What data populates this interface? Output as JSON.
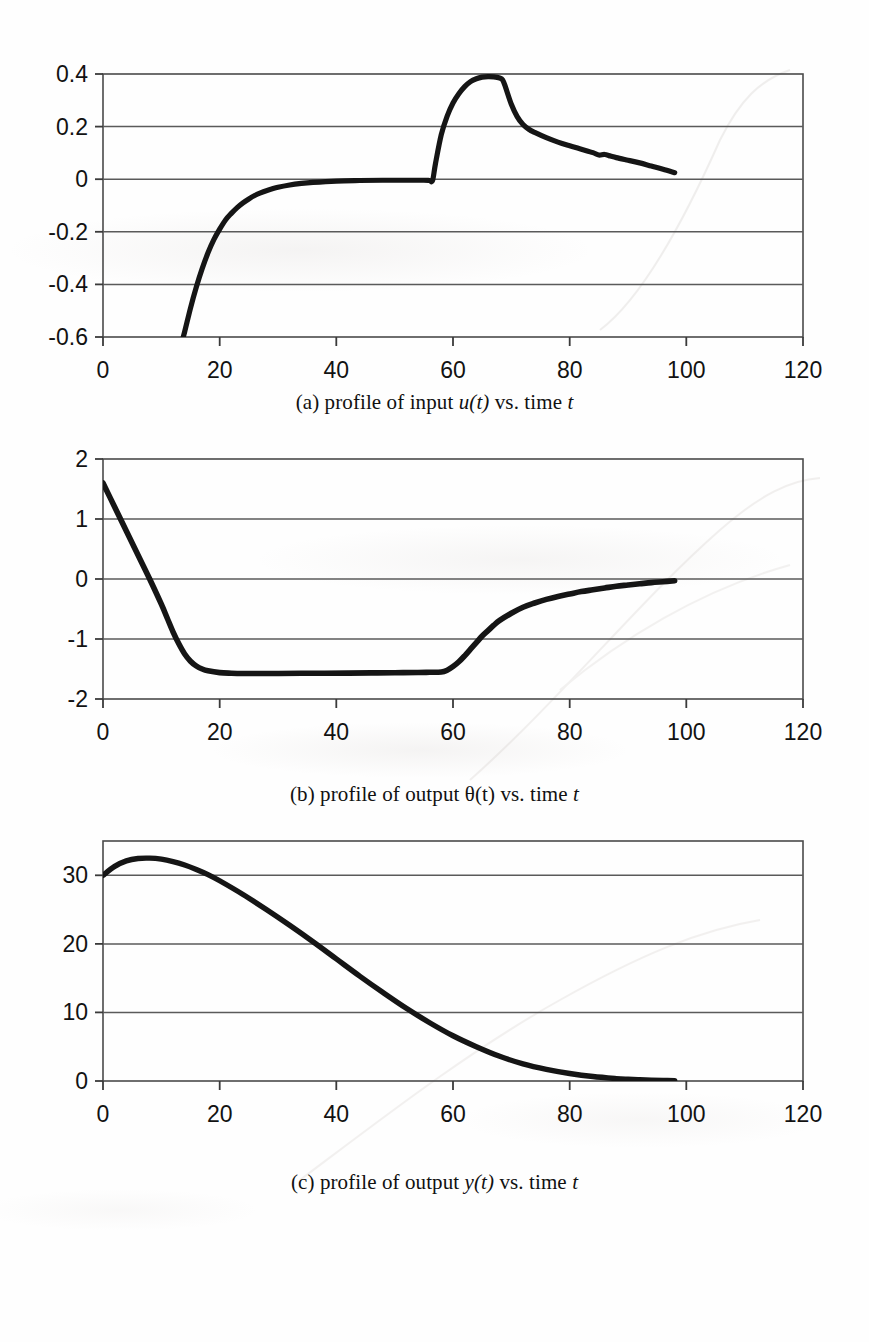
{
  "figure": {
    "background_color": "#fefefe",
    "ink_color": "#151515",
    "grid_color": "#555555",
    "charts": [
      {
        "id": "chart-a",
        "caption_prefix": "(a) profile of input ",
        "caption_symbol": "u(t)",
        "caption_suffix": " vs. time ",
        "caption_var": "t",
        "caption_plain": "(a) profile of input u(t) vs. time t"
      },
      {
        "id": "chart-b",
        "caption_prefix": "(b) profile of output ",
        "caption_symbol": "θ(t)",
        "caption_suffix": " vs. time ",
        "caption_var": "t",
        "caption_plain": "(b) profile of output θ(t) vs. time t"
      },
      {
        "id": "chart-c",
        "caption_prefix": "(c) profile of output ",
        "caption_symbol": "y(t)",
        "caption_suffix": " vs. time ",
        "caption_var": "t",
        "caption_plain": "(c) profile of output y(t) vs. time t"
      }
    ]
  },
  "chart_data": [
    {
      "type": "line",
      "id": "chart-a",
      "title": "(a) profile of input u(t) vs. time t",
      "xlabel": "t",
      "ylabel": "u(t)",
      "xlim": [
        0,
        120
      ],
      "ylim": [
        -0.6,
        0.4
      ],
      "xticks": [
        0,
        20,
        40,
        60,
        80,
        100,
        120
      ],
      "yticks": [
        0.4,
        0.2,
        0,
        -0.2,
        -0.4,
        -0.6
      ],
      "xtick_labels": [
        "0",
        "20",
        "40",
        "60",
        "80",
        "100",
        "120"
      ],
      "ytick_labels": [
        "0.4",
        "0.2",
        "0",
        "-0.2",
        "-0.4",
        "-0.6"
      ],
      "grid": "horizontal",
      "legend": "none",
      "series": [
        {
          "name": "u(t)",
          "note": "curve is clipped by the axis bottom before t=13.5; data drawn only from t=13.5 to t=98",
          "x": [
            13.5,
            14,
            15,
            16,
            17,
            18,
            19,
            20,
            21,
            22,
            23,
            24,
            25,
            26,
            27,
            28,
            30,
            32,
            34,
            36,
            40,
            44,
            48,
            52,
            55,
            56,
            56.5,
            57,
            58,
            59,
            60,
            61,
            62,
            63,
            64,
            65,
            66,
            67,
            68,
            68.5,
            69,
            70,
            71,
            72,
            73,
            74,
            76,
            78,
            80,
            82,
            84,
            85,
            86,
            87,
            88,
            90,
            92,
            94,
            96,
            98
          ],
          "y": [
            -0.62,
            -0.58,
            -0.49,
            -0.41,
            -0.34,
            -0.28,
            -0.23,
            -0.19,
            -0.155,
            -0.13,
            -0.108,
            -0.09,
            -0.075,
            -0.062,
            -0.052,
            -0.044,
            -0.031,
            -0.022,
            -0.016,
            -0.012,
            -0.007,
            -0.005,
            -0.004,
            -0.004,
            -0.004,
            -0.005,
            -0.005,
            0.06,
            0.17,
            0.24,
            0.29,
            0.325,
            0.352,
            0.371,
            0.382,
            0.388,
            0.39,
            0.389,
            0.385,
            0.378,
            0.35,
            0.285,
            0.238,
            0.208,
            0.19,
            0.178,
            0.158,
            0.141,
            0.127,
            0.114,
            0.101,
            0.092,
            0.094,
            0.088,
            0.082,
            0.072,
            0.062,
            0.05,
            0.038,
            0.025
          ]
        }
      ]
    },
    {
      "type": "line",
      "id": "chart-b",
      "title": "(b) profile of output θ(t) vs. time t",
      "xlabel": "t",
      "ylabel": "θ(t)",
      "xlim": [
        0,
        120
      ],
      "ylim": [
        -2,
        2
      ],
      "xticks": [
        0,
        20,
        40,
        60,
        80,
        100,
        120
      ],
      "yticks": [
        2,
        1,
        0,
        -1,
        -2
      ],
      "xtick_labels": [
        "0",
        "20",
        "40",
        "60",
        "80",
        "100",
        "120"
      ],
      "ytick_labels": [
        "2",
        "1",
        "0",
        "-1",
        "-2"
      ],
      "grid": "horizontal",
      "legend": "none",
      "series": [
        {
          "name": "θ(t)",
          "x": [
            0,
            2,
            4,
            6,
            8,
            10,
            11,
            12,
            13,
            14,
            15,
            16,
            17,
            18,
            20,
            22,
            24,
            26,
            30,
            34,
            38,
            42,
            46,
            50,
            54,
            56,
            58,
            59,
            60,
            61,
            62,
            63,
            64,
            65,
            66,
            67,
            68,
            70,
            72,
            74,
            76,
            78,
            80,
            82,
            84,
            86,
            88,
            90,
            92,
            94,
            96,
            98
          ],
          "y": [
            1.6,
            1.2,
            0.8,
            0.4,
            0.0,
            -0.42,
            -0.65,
            -0.88,
            -1.08,
            -1.25,
            -1.37,
            -1.45,
            -1.5,
            -1.53,
            -1.56,
            -1.57,
            -1.575,
            -1.575,
            -1.575,
            -1.572,
            -1.57,
            -1.568,
            -1.565,
            -1.562,
            -1.558,
            -1.555,
            -1.55,
            -1.52,
            -1.46,
            -1.38,
            -1.28,
            -1.17,
            -1.06,
            -0.95,
            -0.86,
            -0.77,
            -0.69,
            -0.57,
            -0.47,
            -0.4,
            -0.34,
            -0.29,
            -0.25,
            -0.21,
            -0.18,
            -0.15,
            -0.12,
            -0.1,
            -0.08,
            -0.06,
            -0.045,
            -0.03
          ]
        }
      ]
    },
    {
      "type": "line",
      "id": "chart-c",
      "title": "(c) profile of output y(t) vs. time t",
      "xlabel": "t",
      "ylabel": "y(t)",
      "xlim": [
        0,
        120
      ],
      "ylim": [
        0,
        35
      ],
      "xticks": [
        0,
        20,
        40,
        60,
        80,
        100,
        120
      ],
      "yticks": [
        30,
        20,
        10,
        0
      ],
      "xtick_labels": [
        "0",
        "20",
        "40",
        "60",
        "80",
        "100",
        "120"
      ],
      "ytick_labels": [
        "30",
        "20",
        "10",
        "0"
      ],
      "grid": "horizontal",
      "legend": "none",
      "series": [
        {
          "name": "y(t)",
          "x": [
            0,
            2,
            4,
            6,
            8,
            10,
            12,
            14,
            16,
            18,
            20,
            24,
            28,
            32,
            36,
            40,
            44,
            48,
            52,
            56,
            60,
            64,
            68,
            72,
            76,
            80,
            84,
            88,
            90,
            92,
            94,
            96,
            98
          ],
          "y": [
            30.0,
            31.3,
            32.1,
            32.45,
            32.5,
            32.35,
            32.0,
            31.5,
            30.85,
            30.1,
            29.2,
            27.2,
            25.0,
            22.7,
            20.3,
            17.8,
            15.3,
            12.9,
            10.6,
            8.5,
            6.6,
            5.0,
            3.6,
            2.5,
            1.7,
            1.1,
            0.65,
            0.35,
            0.25,
            0.18,
            0.12,
            0.08,
            0.05
          ]
        }
      ]
    }
  ]
}
